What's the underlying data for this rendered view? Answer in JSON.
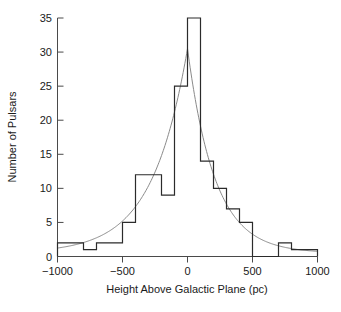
{
  "chart_data": {
    "type": "bar",
    "title": "",
    "subtitle": "",
    "xlabel": "Height Above Galactic Plane (pc)",
    "ylabel": "Number of Pulsars",
    "xlim": [
      -1000,
      1000
    ],
    "ylim": [
      0,
      35
    ],
    "grid": false,
    "legend": null,
    "bin_width": 100,
    "bin_edges": [
      -1000,
      -900,
      -800,
      -700,
      -600,
      -500,
      -400,
      -300,
      -200,
      -100,
      0,
      100,
      200,
      300,
      400,
      500,
      600,
      700,
      800,
      900,
      1000
    ],
    "categories": [
      "-1000 to -900",
      "-900 to -800",
      "-800 to -700",
      "-700 to -600",
      "-600 to -500",
      "-500 to -400",
      "-400 to -300",
      "-300 to -200",
      "-200 to -100",
      "-100 to 0",
      "0 to 100",
      "100 to 200",
      "200 to 300",
      "300 to 400",
      "400 to 500",
      "500 to 600",
      "600 to 700",
      "700 to 800",
      "800 to 900",
      "900 to 1000"
    ],
    "values": [
      2,
      2,
      1,
      2,
      2,
      5,
      12,
      12,
      9,
      25,
      35,
      14,
      10,
      7,
      5,
      0,
      0,
      2,
      1,
      1
    ],
    "x_ticks": [
      -1000,
      -500,
      0,
      500,
      1000
    ],
    "x_tick_labels": [
      "-1000",
      "-500",
      "0",
      "500",
      "1000"
    ],
    "y_ticks": [
      0,
      5,
      10,
      15,
      20,
      25,
      30,
      35
    ],
    "y_tick_labels": [
      "0",
      "5",
      "10",
      "15",
      "20",
      "25",
      "30",
      "35"
    ],
    "series": [
      {
        "name": "Pulsar count histogram",
        "type": "bar",
        "color": "#2b2b2b",
        "values": [
          2,
          2,
          1,
          2,
          2,
          5,
          12,
          12,
          9,
          25,
          35,
          14,
          10,
          7,
          5,
          0,
          0,
          2,
          1,
          1
        ]
      },
      {
        "name": "Exponential fit curve",
        "type": "line",
        "color": "#8a8a8a",
        "description": "smooth two-sided exponential decay fit peaking near z = 0",
        "peak_value": 30,
        "peak_x": 0,
        "scale_height_left": 270,
        "scale_height_right": 210,
        "baseline": 0.5
      }
    ]
  },
  "axes": {
    "x_title": "Height Above Galactic Plane (pc)",
    "y_title": "Number of Pulsars"
  },
  "colors": {
    "histogram": "#2b2b2b",
    "fit_curve": "#8a8a8a",
    "axis": "#4a4a4a",
    "text": "#1a1a1a",
    "background": "#ffffff"
  }
}
